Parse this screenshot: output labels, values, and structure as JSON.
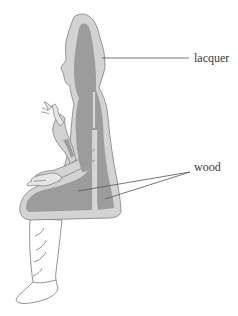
{
  "diagram": {
    "labels": [
      {
        "id": "lacquer",
        "text": "lacquer"
      },
      {
        "id": "wood",
        "text": "wood"
      }
    ],
    "colors": {
      "lacquer_fill": "#d3d3d3",
      "wood_fill": "#9c9c9c",
      "outline": "#8a8a8a",
      "leader": "#555555",
      "text": "#3a3a3a",
      "background": "#ffffff"
    }
  }
}
